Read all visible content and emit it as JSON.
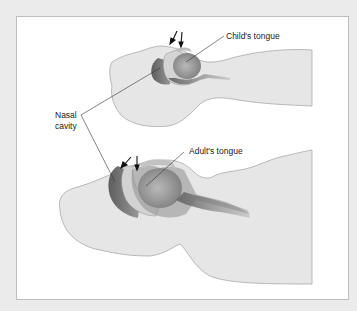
{
  "figure": {
    "labels": {
      "child_tongue": "Child's tongue",
      "adult_tongue": "Adult's tongue",
      "nasal_cavity_line1": "Nasal",
      "nasal_cavity_line2": "cavity"
    },
    "colors": {
      "background": "#ebebeb",
      "frame": "#ffffff",
      "frame_border": "#bdbdbd",
      "head_fill": "#e6e6e6",
      "head_outline": "#a9a9a9",
      "tract_dark": "#6f6f6f",
      "tract_mid": "#9a9a9a",
      "tract_light": "#c9c9c9",
      "leader_line": "#333333",
      "text": "#222222"
    }
  }
}
